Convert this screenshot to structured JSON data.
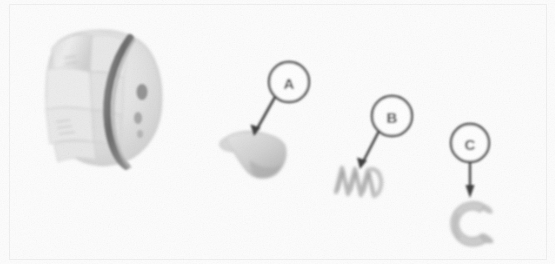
{
  "figure": {
    "background_color": "#fdfdfd",
    "width": 555,
    "height": 264,
    "ink_color": "#4a4a4a",
    "part_fill_color": "#d8d8d8"
  },
  "callouts": [
    {
      "id": "A",
      "label": "A",
      "circle": {
        "cx": 289,
        "cy": 82,
        "r": 20
      },
      "leader": {
        "x1": 275,
        "y1": 97,
        "x2": 254,
        "y2": 134
      },
      "points_to": "flared-valve-poppet"
    },
    {
      "id": "B",
      "label": "B",
      "circle": {
        "cx": 392,
        "cy": 116,
        "r": 20
      },
      "leader": {
        "x1": 379,
        "y1": 131,
        "x2": 360,
        "y2": 167
      },
      "points_to": "coil-spring"
    },
    {
      "id": "C",
      "label": "C",
      "circle": {
        "cx": 470,
        "cy": 143,
        "r": 19
      },
      "leader": {
        "x1": 470,
        "y1": 162,
        "x2": 470,
        "y2": 196
      },
      "points_to": "retaining-c-clip"
    }
  ],
  "parts": [
    {
      "id": "threaded-cap-body",
      "name": "Threaded cap body with O-ring groove",
      "position": {
        "x": 42,
        "y": 22,
        "width": 130,
        "height": 140
      }
    },
    {
      "id": "flared-valve-poppet",
      "name": "Flared valve poppet",
      "callout": "A",
      "position": {
        "x": 222,
        "y": 128,
        "width": 72,
        "height": 52
      }
    },
    {
      "id": "coil-spring",
      "name": "Coil spring",
      "callout": "B",
      "position": {
        "x": 333,
        "y": 163,
        "width": 62,
        "height": 46
      }
    },
    {
      "id": "retaining-c-clip",
      "name": "Retaining C-clip snap ring",
      "callout": "C",
      "position": {
        "x": 443,
        "y": 196,
        "width": 58,
        "height": 56
      }
    }
  ]
}
